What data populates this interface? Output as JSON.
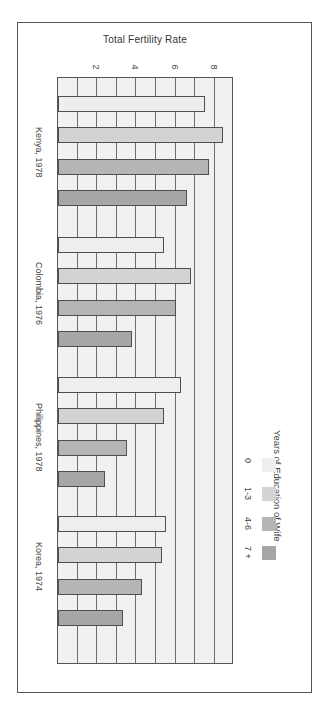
{
  "chart_data": {
    "type": "bar",
    "orientation": "horizontal (figure printed rotated 90 degrees)",
    "title": "",
    "xlabel": "",
    "ylabel": "Total Fertility Rate",
    "value_axis_label": "Total Fertility Rate",
    "ticks": [
      2,
      4,
      6,
      8
    ],
    "ylim": [
      0,
      9
    ],
    "grid": true,
    "categories": [
      "Kenya, 1978",
      "Colombia, 1976",
      "Philippines, 1978",
      "Korea, 1974"
    ],
    "legend_title": "Years of Education of Wife",
    "legend_position": "right",
    "series": [
      {
        "name": "0",
        "color": "#eeeeee",
        "values": [
          7.5,
          5.4,
          6.3,
          5.5
        ]
      },
      {
        "name": "1-3",
        "color": "#d3d3d3",
        "values": [
          8.4,
          6.8,
          5.4,
          5.3
        ]
      },
      {
        "name": "4-6",
        "color": "#b5b5b5",
        "values": [
          7.7,
          6.0,
          3.5,
          4.3
        ]
      },
      {
        "name": "7 +",
        "color": "#a6a6a6",
        "values": [
          6.6,
          3.8,
          2.4,
          3.3
        ]
      }
    ]
  },
  "axis": {
    "title": "Total Fertility Rate",
    "ticks": [
      "2",
      "4",
      "6",
      "8"
    ]
  },
  "groups": [
    "Kenya, 1978",
    "Colombia, 1976",
    "Philippines, 1978",
    "Korea, 1974"
  ],
  "legend": {
    "title": "Years of Education of Wife",
    "items": [
      {
        "label": "0",
        "color": "#eeeeee"
      },
      {
        "label": "1-3",
        "color": "#d3d3d3"
      },
      {
        "label": "4-6",
        "color": "#b5b5b5"
      },
      {
        "label": "7 +",
        "color": "#a6a6a6"
      }
    ]
  }
}
